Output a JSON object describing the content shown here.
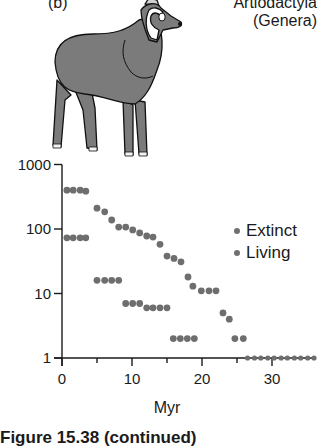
{
  "panel": {
    "label": "(b)",
    "group_title_line1": "Artiodactyla",
    "group_title_line2": "(Genera)"
  },
  "caption": "Figure 15.38 (continued)",
  "colors": {
    "dot": "#6e6e6e",
    "axis": "#1a1a1a",
    "animal_fill": "#7b7b7b"
  },
  "legend": [
    {
      "label": "Extinct"
    },
    {
      "label": "Living"
    }
  ],
  "chart_data": {
    "type": "scatter",
    "title": "Artiodactyla (Genera)",
    "xlabel": "Myr",
    "ylabel": "",
    "yscale": "log",
    "xlim": [
      0,
      37
    ],
    "ylim": [
      1,
      1000
    ],
    "xticks": [
      0,
      10,
      20,
      30
    ],
    "xticks_minor": [
      5,
      15,
      25
    ],
    "yticks": [
      1,
      10,
      100,
      1000
    ],
    "ytick_labels": [
      "1",
      "10",
      "100",
      "1000"
    ],
    "grid": false,
    "legend_position": "right-middle",
    "series": [
      {
        "name": "Extinct",
        "x": [
          0.7,
          1.6,
          2.6,
          3.4,
          5.0,
          6.1,
          7.1,
          8.1,
          9.1,
          10.1,
          11.1,
          12.1,
          13.0,
          14.0,
          15.0,
          16.0,
          17.0,
          18.0,
          18.7,
          19.9,
          21.0,
          22.0,
          23.0,
          23.9,
          24.7,
          25.9,
          26.5,
          27.5,
          28.4,
          29.4,
          30.3,
          31.3,
          32.2,
          33.2,
          34.1,
          35.1,
          36.0
        ],
        "y": [
          400,
          400,
          400,
          385,
          210,
          185,
          138,
          107,
          107,
          97,
          87,
          78,
          75,
          58,
          38,
          35,
          31,
          18,
          13,
          11,
          11,
          11,
          5,
          4,
          2,
          2,
          1,
          1,
          1,
          1,
          1,
          1,
          1,
          1,
          1,
          1,
          1
        ]
      },
      {
        "name": "Living",
        "x": [
          0.7,
          1.6,
          2.6,
          3.4,
          5.0,
          6.1,
          7.1,
          8.1,
          9.1,
          10.1,
          11.1,
          12.1,
          13.0,
          14.0,
          15.0,
          15.9,
          16.9,
          17.9,
          18.9
        ],
        "y": [
          73,
          73,
          73,
          73,
          16,
          16,
          16,
          16,
          7,
          7,
          7,
          6,
          6,
          6,
          6,
          2,
          2,
          2,
          2
        ]
      }
    ]
  }
}
